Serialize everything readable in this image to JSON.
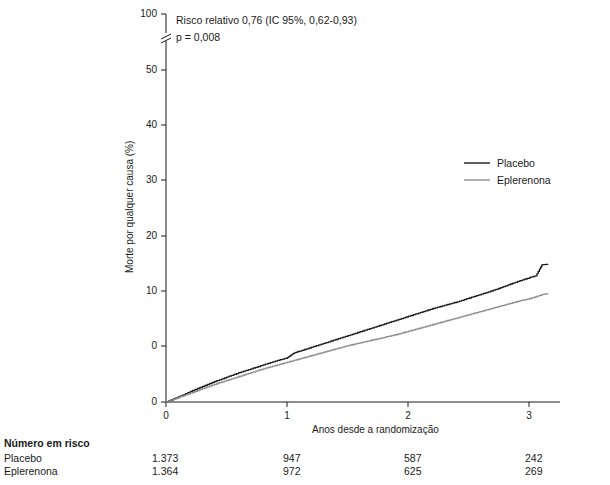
{
  "chart_data": {
    "type": "line",
    "title": "",
    "xlabel": "Anos desde a randomização",
    "ylabel": "Morte por qualquer causa (%)",
    "xlim": [
      0,
      3.25
    ],
    "ylim": [
      0,
      100
    ],
    "y_ticks": [
      "0",
      "10",
      "20",
      "30",
      "40",
      "50",
      "60",
      "100"
    ],
    "x_ticks": [
      "0",
      "1",
      "2",
      "3"
    ],
    "axis_break": true,
    "grid": false,
    "legend_position": "right-middle",
    "annotations": [
      "Risco relativo 0,76 (IC 95%, 0,62-0,93)",
      "p = 0,008"
    ],
    "series": [
      {
        "name": "Placebo",
        "color": "#1a1a1a",
        "x": [
          0,
          0.1,
          0.2,
          0.3,
          0.4,
          0.5,
          0.6,
          0.7,
          0.8,
          0.9,
          1.0,
          1.05,
          1.1,
          1.2,
          1.3,
          1.4,
          1.5,
          1.6,
          1.7,
          1.8,
          1.9,
          2.0,
          2.1,
          2.2,
          2.3,
          2.4,
          2.5,
          2.6,
          2.7,
          2.8,
          2.9,
          3.0,
          3.05,
          3.1,
          3.15
        ],
        "y": [
          0,
          0.9,
          1.9,
          2.8,
          3.7,
          4.5,
          5.3,
          6.0,
          6.7,
          7.4,
          8.0,
          8.8,
          9.2,
          9.9,
          10.6,
          11.3,
          12.0,
          12.7,
          13.4,
          14.1,
          14.8,
          15.5,
          16.2,
          16.9,
          17.5,
          18.1,
          18.8,
          19.5,
          20.2,
          21.0,
          21.8,
          22.5,
          22.8,
          24.8,
          24.9
        ]
      },
      {
        "name": "Eplerenona",
        "color": "#8c8c8c",
        "x": [
          0,
          0.1,
          0.2,
          0.3,
          0.4,
          0.5,
          0.6,
          0.7,
          0.8,
          0.9,
          1.0,
          1.1,
          1.2,
          1.3,
          1.4,
          1.5,
          1.6,
          1.7,
          1.8,
          1.9,
          2.0,
          2.1,
          2.2,
          2.3,
          2.4,
          2.5,
          2.6,
          2.7,
          2.8,
          2.9,
          3.0,
          3.1,
          3.15
        ],
        "y": [
          0,
          0.8,
          1.6,
          2.4,
          3.2,
          3.9,
          4.6,
          5.3,
          6.0,
          6.6,
          7.2,
          7.8,
          8.4,
          9.0,
          9.6,
          10.2,
          10.7,
          11.2,
          11.7,
          12.2,
          12.8,
          13.4,
          14.0,
          14.6,
          15.2,
          15.8,
          16.4,
          17.0,
          17.6,
          18.2,
          18.7,
          19.4,
          19.6
        ]
      }
    ]
  },
  "legend": {
    "items": [
      {
        "label": "Placebo",
        "color": "#1a1a1a"
      },
      {
        "label": "Eplerenona",
        "color": "#8c8c8c"
      }
    ]
  },
  "risk_table": {
    "title": "Número em risco",
    "rows": [
      {
        "label": "Placebo",
        "values": [
          "1.373",
          "947",
          "587",
          "242"
        ]
      },
      {
        "label": "Eplerenona",
        "values": [
          "1.364",
          "972",
          "625",
          "269"
        ]
      }
    ]
  }
}
